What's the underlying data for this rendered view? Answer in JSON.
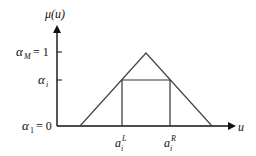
{
  "diagram": {
    "y_axis": {
      "label": "μ(u)"
    },
    "x_axis": {
      "label": "u"
    },
    "y_ticks": [
      {
        "name": "alpha-M",
        "symbol": "α",
        "sub": "M",
        "eq": "= 1"
      },
      {
        "name": "alpha-i",
        "symbol": "α",
        "sub": "i",
        "eq": ""
      },
      {
        "name": "alpha-1",
        "symbol": "α",
        "sub": "1",
        "eq": "= 0"
      }
    ],
    "x_ticks": [
      {
        "name": "a-i-L",
        "symbol": "a",
        "sub": "i",
        "sup": "L"
      },
      {
        "name": "a-i-R",
        "symbol": "a",
        "sub": "i",
        "sup": "R"
      }
    ],
    "colors": {
      "line": "#333333",
      "axis": "#111111"
    }
  }
}
